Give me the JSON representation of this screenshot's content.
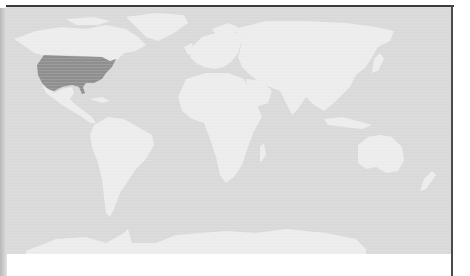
{
  "map": {
    "type": "choropleth-world",
    "projection": "equirectangular-like",
    "highlighted_regions": [
      {
        "name": "United States",
        "color": "#8f8f8f"
      }
    ],
    "colors": {
      "ocean": "#d9d9d9",
      "land": "#ececec",
      "highlight": "#8f8f8f",
      "frame": "#3a3a3a",
      "background": "#ffffff"
    },
    "legend": null,
    "labels": []
  }
}
